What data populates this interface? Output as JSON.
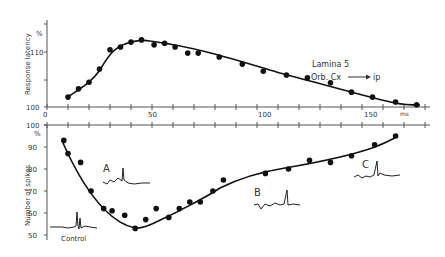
{
  "colors": {
    "ink": "#111111",
    "axis": "#555555",
    "text": "#333333",
    "background": "#ffffff"
  },
  "annotation": {
    "line1": "Lamina  5",
    "line2": "Orb. Cx",
    "line2_target": "ip"
  },
  "shared_x_axis": {
    "unit_label": "ms",
    "tick_labels": [
      "0",
      "50",
      "100",
      "150"
    ],
    "range": [
      0,
      180
    ],
    "minor_tick_step": 10
  },
  "top_panel": {
    "ylabel": "Response  latency",
    "unit": "%",
    "tick_labels": [
      "110",
      "100"
    ]
  },
  "bottom_panel": {
    "ylabel": "Number  of  spikes",
    "unit": "%",
    "tick_labels": [
      "100",
      "90",
      "80",
      "70",
      "60",
      "50"
    ],
    "inset_labels": {
      "control": "Control",
      "a": "A",
      "b": "B",
      "c": "C"
    }
  },
  "chart_data": [
    {
      "type": "scatter",
      "title": "Lamina 5 — Orb. Cx → ip",
      "xlabel": "ms",
      "ylabel": "Response latency (%)",
      "xlim": [
        0,
        180
      ],
      "ylim": [
        100,
        115
      ],
      "grid": false,
      "x_ticks": [
        0,
        50,
        100,
        150
      ],
      "y_ticks": [
        100,
        105,
        110,
        115
      ],
      "series": [
        {
          "name": "Response latency",
          "x": [
            10,
            15,
            20,
            25,
            30,
            35,
            40,
            45,
            51,
            56,
            61,
            67,
            72,
            82,
            93,
            103,
            114,
            124,
            135,
            145,
            155,
            166,
            176
          ],
          "values": [
            101.8,
            103.3,
            104.5,
            106.9,
            110.4,
            110.9,
            111.8,
            112.2,
            111.3,
            111.6,
            110.9,
            109.8,
            109.8,
            109.1,
            107.8,
            106.5,
            105.8,
            105.3,
            104.4,
            102.7,
            101.8,
            100.9,
            100.4
          ]
        }
      ],
      "fit_curve": "smooth sigmoidal rise to peak ~112% at ~45 ms, then near-linear decline to ~100% at ~176 ms"
    },
    {
      "type": "scatter",
      "title": "",
      "xlabel": "ms",
      "ylabel": "Number of spikes (%)",
      "xlim": [
        0,
        180
      ],
      "ylim": [
        50,
        100
      ],
      "grid": false,
      "x_ticks": [
        0,
        50,
        100,
        150
      ],
      "y_ticks": [
        50,
        60,
        70,
        80,
        90,
        100
      ],
      "series": [
        {
          "name": "Number of spikes",
          "x": [
            8,
            10,
            16,
            21,
            27,
            31,
            37,
            42,
            47,
            52,
            58,
            63,
            68,
            73,
            79,
            84,
            104,
            115,
            125,
            135,
            145,
            156,
            166
          ],
          "values": [
            93,
            87,
            83,
            70,
            62,
            61,
            59,
            53,
            57,
            62,
            58,
            62,
            65,
            65,
            70,
            75,
            78,
            80,
            84,
            83,
            86,
            91,
            95
          ]
        }
      ],
      "fit_curve": "U-shaped: falls from ~93% at 8 ms to minimum ~53% at ~42 ms, then rises to ~95% at ~166 ms",
      "annotations": [
        "Control",
        "A",
        "B",
        "C"
      ]
    }
  ]
}
